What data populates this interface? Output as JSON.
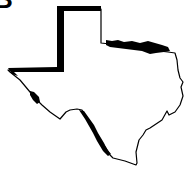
{
  "figure": {
    "panel_label": "B",
    "highlighted_borders": [
      "Panhandle west and north border",
      "Red River (northern border)",
      "Rio Grande segments (western border)"
    ],
    "colors": {
      "background": "#ffffff",
      "outline": "#000000",
      "highlight": "#000000"
    }
  }
}
